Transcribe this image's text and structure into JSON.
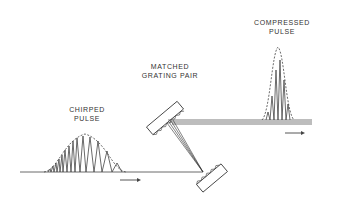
{
  "labels": {
    "chirped": [
      "CHIRPED",
      "PULSE"
    ],
    "grating": [
      "MATCHED",
      "GRATING PAIR"
    ],
    "compressed": [
      "COMPRESSED",
      "PULSE"
    ]
  },
  "colors": {
    "ink": "#333333",
    "background": "#ffffff"
  },
  "components": [
    "chirped-pulse",
    "direction-arrow",
    "upper-grating",
    "lower-grating",
    "compressed-pulse",
    "output-beam"
  ]
}
